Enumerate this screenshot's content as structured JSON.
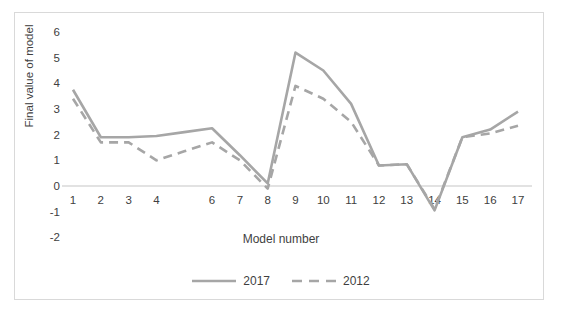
{
  "chart_data": {
    "type": "line",
    "title": "",
    "xlabel": "Model number",
    "ylabel": "Final value of model",
    "categories": [
      1,
      2,
      3,
      4,
      5,
      6,
      7,
      8,
      9,
      10,
      11,
      12,
      13,
      14,
      15,
      16,
      17
    ],
    "xtick_labels": [
      "1",
      "2",
      "3",
      "4",
      "",
      "6",
      "7",
      "8",
      "9",
      "10",
      "11",
      "12",
      "13",
      "14",
      "15",
      "16",
      "17"
    ],
    "ytick_labels": [
      "6",
      "5",
      "4",
      "3",
      "2",
      "1",
      "0",
      "-1",
      "-2"
    ],
    "ytick_values": [
      6,
      5,
      4,
      3,
      2,
      1,
      0,
      -1,
      -2
    ],
    "ylim": [
      -2,
      6
    ],
    "xlim": [
      1,
      17
    ],
    "grid": false,
    "zero_line": true,
    "legend_position": "bottom",
    "series": [
      {
        "name": "2017",
        "style": "solid",
        "color": "#a6a6a6",
        "values": [
          3.75,
          1.9,
          1.9,
          1.95,
          2.1,
          2.25,
          1.2,
          0.1,
          5.2,
          4.5,
          3.2,
          0.8,
          0.85,
          -0.95,
          1.9,
          2.2,
          2.9
        ]
      },
      {
        "name": "2012",
        "style": "dashed",
        "color": "#a6a6a6",
        "values": [
          3.4,
          1.7,
          1.7,
          1.0,
          1.35,
          1.7,
          1.0,
          -0.1,
          3.9,
          3.4,
          2.5,
          0.8,
          0.85,
          -0.9,
          1.9,
          2.05,
          2.35
        ]
      }
    ]
  },
  "axes": {
    "y_title": "Final value of model",
    "x_title": "Model number"
  },
  "legend": {
    "items": [
      {
        "label": "2017",
        "style": "solid"
      },
      {
        "label": "2012",
        "style": "dashed"
      }
    ]
  },
  "colors": {
    "series_line": "#a6a6a6",
    "frame": "#d9d9d9",
    "zero_axis": "#d9d9d9",
    "text": "#404040",
    "background": "#ffffff"
  }
}
